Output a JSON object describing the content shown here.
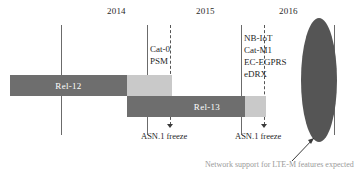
{
  "figure": {
    "years": [
      {
        "label": "2014",
        "x": 107,
        "y": 6
      },
      {
        "label": "2015",
        "x": 196,
        "y": 6
      },
      {
        "label": "2016",
        "x": 279,
        "y": 6
      }
    ],
    "gridlines": [
      {
        "name": "year-divider-1",
        "x": 61,
        "y": 25,
        "height": 110,
        "style": "solid"
      },
      {
        "name": "year-divider-2",
        "x": 147,
        "y": 25,
        "height": 110,
        "style": "solid"
      },
      {
        "name": "year-divider-3",
        "x": 241,
        "y": 25,
        "height": 110,
        "style": "solid"
      },
      {
        "name": "year-divider-4",
        "x": 334,
        "y": 25,
        "height": 110,
        "style": "solid"
      }
    ],
    "freeze_markers": [
      {
        "name": "asn1-freeze-1",
        "x": 170,
        "y": 25,
        "height": 103,
        "label": "ASN.1 freeze",
        "label_x": 141,
        "label_y": 131
      },
      {
        "name": "asn1-freeze-2",
        "x": 264,
        "y": 25,
        "height": 103,
        "label": "ASN.1 freeze",
        "label_x": 235,
        "label_y": 131
      }
    ],
    "bars": [
      {
        "name": "rel-12",
        "label": "Rel-12",
        "y": 75,
        "height": 21,
        "segments": [
          {
            "x": 10,
            "width": 117,
            "tone": "dark"
          },
          {
            "x": 127,
            "width": 45,
            "tone": "light"
          }
        ],
        "label_x": 30,
        "label_color": "#ffffff"
      },
      {
        "name": "rel-13",
        "label": "Rel-13",
        "y": 96,
        "height": 21,
        "segments": [
          {
            "x": 127,
            "width": 118,
            "tone": "dark"
          },
          {
            "x": 245,
            "width": 21,
            "tone": "light"
          }
        ],
        "label_x": 168,
        "label_color": "#ffffff"
      }
    ],
    "feature_groups": [
      {
        "name": "rel12-features",
        "x": 150,
        "y": 44,
        "items": [
          "Cat-0",
          "PSM"
        ]
      },
      {
        "name": "rel13-features",
        "x": 244,
        "y": 33,
        "items": [
          "NB-IoT",
          "Cat-M1",
          "EC-EGPRS",
          "eDRX"
        ]
      }
    ],
    "highlight": {
      "name": "deployment-ellipse",
      "x": 301,
      "y": 18,
      "width": 36,
      "height": 124,
      "color": "#555555"
    },
    "caption": {
      "text": "Network support for LTE-M features expected",
      "x": 205,
      "y": 160
    },
    "colors": {
      "bar_dark": "#6e6e6e",
      "bar_light": "#c9c9c9",
      "gridline": "#6b6b6b",
      "dashed": "#555555",
      "ellipse": "#555555",
      "text": "#1f1f1f"
    }
  }
}
